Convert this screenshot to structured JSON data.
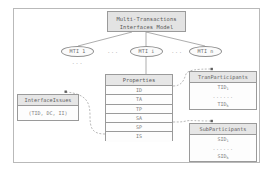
{
  "diagram": {
    "title": "Multi-Transactions Interfaces Model",
    "root": {
      "line1": "Multi-Transactions",
      "line2": "Interfaces Model"
    },
    "instances": [
      {
        "name": "MTI",
        "index": "1",
        "label": "MTI 1"
      },
      {
        "name": "MTI",
        "index": "i",
        "label": "MTI i"
      },
      {
        "name": "MTI",
        "index": "n",
        "label": "MTI n"
      }
    ],
    "ellipsis": "...",
    "properties": {
      "header": "Properties",
      "rows": [
        "ID",
        "TA",
        "TP",
        "SA",
        "SP",
        "IS"
      ]
    },
    "interface_issues": {
      "header": "InterfaceIssues",
      "body": "(TID, DC, II)"
    },
    "tran_participants": {
      "header": "TranParticipants",
      "first": "TID",
      "first_sub": "1",
      "ellipsis": "......",
      "last": "TID",
      "last_sub": "k"
    },
    "sub_participants": {
      "header": "SubParticipants",
      "first": "SID",
      "first_sub": "1",
      "ellipsis": "......",
      "last": "SID",
      "last_sub": "k"
    },
    "colors": {
      "frame_border": "#b9b9b9",
      "box_border": "#9a9a9a",
      "header_fill": "#e6e6e6",
      "root_fill": "#e3e3e3",
      "body_fill": "#fdfdfd",
      "text": "#6d6d6d",
      "edge": "#8a8a8a",
      "note_link": "#9b9b9b"
    }
  }
}
